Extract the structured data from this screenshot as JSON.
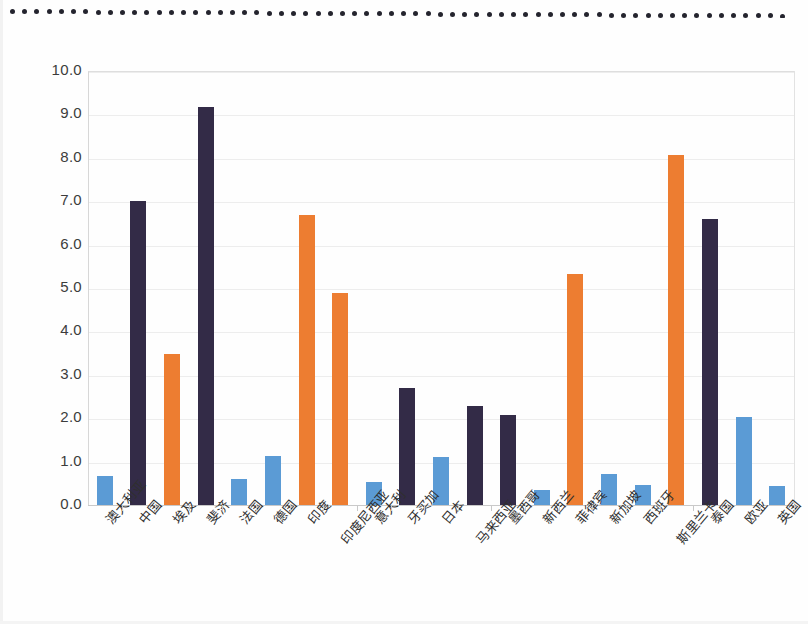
{
  "chart_data": {
    "type": "bar",
    "title": "",
    "xlabel": "",
    "ylabel": "",
    "ylim": [
      0,
      10
    ],
    "ytick_step": 1,
    "ytick_labels": [
      "0.0",
      "1.0",
      "2.0",
      "3.0",
      "4.0",
      "5.0",
      "6.0",
      "7.0",
      "8.0",
      "9.0",
      "10.0"
    ],
    "grid": true,
    "legend": "none",
    "categories": [
      "澳大利亚",
      "中国",
      "埃及",
      "斐济",
      "法国",
      "德国",
      "印度",
      "印度尼西亚",
      "意大利",
      "牙买加",
      "日本",
      "马来西亚",
      "墨西哥",
      "新西兰",
      "菲律宾",
      "新加坡",
      "西班牙",
      "斯里兰卡",
      "泰国",
      "欧亚",
      "英国"
    ],
    "values": [
      0.68,
      7.0,
      3.47,
      9.17,
      0.6,
      1.13,
      6.68,
      4.88,
      0.53,
      2.69,
      1.1,
      2.27,
      2.08,
      0.35,
      5.33,
      0.72,
      0.47,
      8.07,
      6.59,
      2.02,
      0.43
    ],
    "bar_colors": [
      "blue",
      "dark",
      "orange",
      "dark",
      "blue",
      "blue",
      "orange",
      "orange",
      "blue",
      "dark",
      "blue",
      "dark",
      "dark",
      "blue",
      "orange",
      "blue",
      "blue",
      "orange",
      "dark",
      "blue",
      "blue"
    ],
    "stagger": [
      false,
      false,
      false,
      false,
      false,
      false,
      false,
      true,
      false,
      false,
      false,
      true,
      false,
      false,
      false,
      false,
      false,
      true,
      false,
      false,
      false
    ]
  },
  "colors": {
    "blue": "#5B9BD5",
    "dark": "#332B47",
    "orange": "#ED7D31",
    "gridline": "#ededed",
    "axis": "#c9c9c9",
    "text": "#3c3c3c",
    "background": "#fefefe",
    "scan_dot": "#24242e"
  },
  "artifacts": {
    "top_dotted_line": true,
    "dot_count": 64
  }
}
